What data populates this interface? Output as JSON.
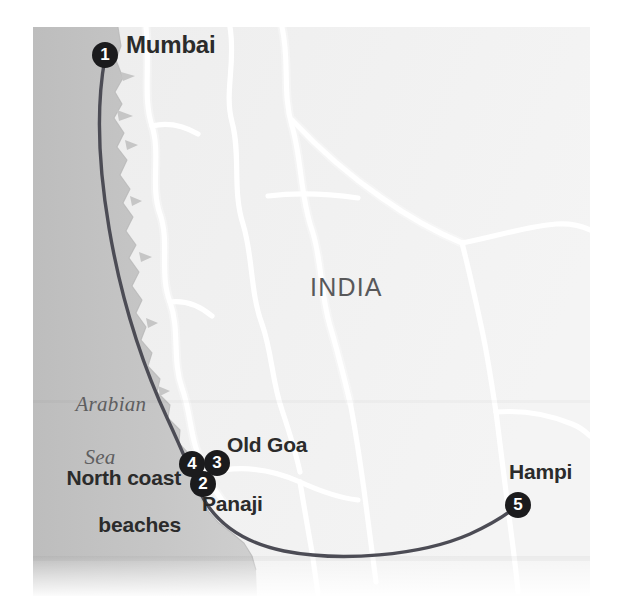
{
  "map": {
    "title": "India west coast route map",
    "country_label": "INDIA",
    "sea_label": {
      "line1": "Arabian",
      "line2": "Sea"
    },
    "colors": {
      "sea": "#c5c5c5",
      "land": "#f1f1f1",
      "road": "#ffffff",
      "route": "#4c4c55",
      "marker_fill": "#1b1b1d",
      "marker_text": "#ffffff",
      "label_text": "#2b2b2b",
      "muted_text": "#5e5e60",
      "page_background": "#ffffff"
    },
    "frame": {
      "x": 33,
      "y": 27,
      "width": 557,
      "height": 569
    }
  },
  "labels": [
    {
      "name": "mumbai",
      "text": "Mumbai"
    },
    {
      "name": "old-goa",
      "text": "Old Goa"
    },
    {
      "name": "panaji",
      "text": "Panaji"
    },
    {
      "name": "hampi",
      "text": "Hampi"
    },
    {
      "name": "north-coast-beaches",
      "line1": "North coast",
      "line2": "beaches"
    }
  ],
  "stops": [
    {
      "number": "1",
      "label": "Mumbai",
      "x": 105,
      "y": 55
    },
    {
      "number": "2",
      "label": "Panaji",
      "x": 203,
      "y": 484
    },
    {
      "number": "3",
      "label": "Old Goa",
      "x": 217,
      "y": 463
    },
    {
      "number": "4",
      "label": "North coast beaches",
      "x": 192,
      "y": 464
    },
    {
      "number": "5",
      "label": "Hampi",
      "x": 518,
      "y": 505
    }
  ]
}
